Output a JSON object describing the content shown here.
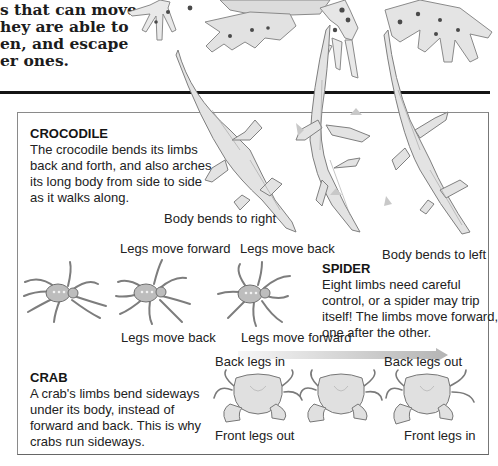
{
  "intro": {
    "lines": [
      "s that can move",
      "hey are able to",
      "en, and escape",
      "er ones."
    ]
  },
  "crocodile": {
    "heading": "CROCODILE",
    "lines": [
      "The crocodile bends its limbs",
      "back and forth, and also arches",
      "its long body from side to side",
      "as it walks along."
    ],
    "labels": {
      "bends_right": "Body bends to right",
      "bends_left": "Body bends to left"
    }
  },
  "spider": {
    "heading": "SPIDER",
    "lines": [
      "Eight limbs need careful",
      "control, or a spider may trip",
      "itself! The limbs move forward,",
      "one after the other."
    ],
    "labels": {
      "top_forward": "Legs move forward",
      "top_back": "Legs move back",
      "bottom_back": "Legs move back",
      "bottom_forward": "Legs move forward"
    }
  },
  "crab": {
    "heading": "CRAB",
    "lines": [
      "A crab's limbs bend sideways",
      "under its body, instead of",
      "forward and back. This is why",
      "crabs run sideways."
    ],
    "labels": {
      "back_in": "Back legs in",
      "back_out": "Back legs out",
      "front_out": "Front legs out",
      "front_in": "Front legs in"
    }
  },
  "colors": {
    "rule": "#141414",
    "panel_border": "#8a8a8a",
    "arrow_start": "#f4f4f4",
    "arrow_end": "#b8b8b8",
    "illustration": "#8f8f8f"
  }
}
